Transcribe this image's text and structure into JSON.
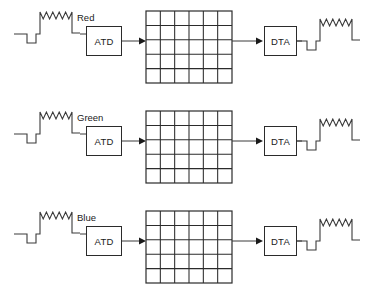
{
  "diagram": {
    "rows": [
      {
        "channel_label": "Red",
        "adc_label": "ATD",
        "dac_label": "DTA",
        "input_signal_name": "analog-input-waveform",
        "output_signal_name": "analog-output-waveform",
        "grid_name": "digital-image-grid",
        "grid_columns": 6,
        "grid_rows": 5
      },
      {
        "channel_label": "Green",
        "adc_label": "ATD",
        "dac_label": "DTA",
        "input_signal_name": "analog-input-waveform",
        "output_signal_name": "analog-output-waveform",
        "grid_name": "digital-image-grid",
        "grid_columns": 6,
        "grid_rows": 5
      },
      {
        "channel_label": "Blue",
        "adc_label": "ATD",
        "dac_label": "DTA",
        "input_signal_name": "analog-input-waveform",
        "output_signal_name": "analog-output-waveform",
        "grid_name": "digital-image-grid",
        "grid_columns": 6,
        "grid_rows": 5
      }
    ],
    "colors": {
      "background": "#ffffff",
      "stroke": "#2b2b2b",
      "wire": "#3a3a3a",
      "text": "#1a1a1a"
    }
  }
}
